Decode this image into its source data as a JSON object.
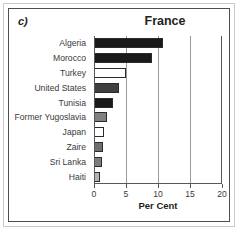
{
  "panel": {
    "label": "c)"
  },
  "chart_data": {
    "type": "bar",
    "orientation": "horizontal",
    "title": "France",
    "xlabel": "Per Cent",
    "ylabel": "",
    "xlim": [
      0,
      20
    ],
    "xticks": [
      0,
      5,
      10,
      15,
      20
    ],
    "xtick_labels": [
      "0",
      "5",
      "10",
      "15",
      "20"
    ],
    "grid": true,
    "grid_axis": "x",
    "legend": "none",
    "categories": [
      "Algeria",
      "Morocco",
      "Turkey",
      "United States",
      "Tunisia",
      "Former Yugoslavia",
      "Japan",
      "Zaire",
      "Sri Lanka",
      "Haiti"
    ],
    "values": [
      10.8,
      9.0,
      5.0,
      3.9,
      3.0,
      2.0,
      1.6,
      1.4,
      1.3,
      1.0
    ],
    "bar_fills": [
      "#1a1a1a",
      "#1a1a1a",
      "#ffffff",
      "#3f3f3f",
      "#1a1a1a",
      "#808080",
      "#ffffff",
      "#6e6e6e",
      "#7d7d7d",
      "#b5b5b5"
    ],
    "bar_edge_color": "#2b2b2b",
    "axis_color": "#58585a",
    "grid_color": "#9a9a9a"
  }
}
